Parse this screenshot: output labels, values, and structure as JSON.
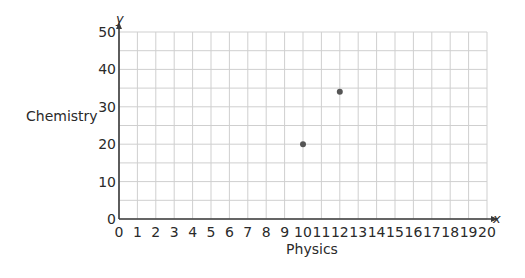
{
  "chart_data": {
    "type": "scatter",
    "title": "",
    "xlabel": "Physics",
    "ylabel": "Chemistry",
    "x_axis_var": "x",
    "y_axis_var": "y",
    "xlim": [
      0,
      20
    ],
    "ylim": [
      0,
      50
    ],
    "x_ticks": [
      0,
      1,
      2,
      3,
      4,
      5,
      6,
      7,
      8,
      9,
      10,
      11,
      12,
      13,
      14,
      15,
      16,
      17,
      18,
      19,
      20
    ],
    "y_ticks": [
      0,
      10,
      20,
      30,
      40,
      50
    ],
    "grid": true,
    "grid_x_step": 1,
    "grid_y_step": 5,
    "points": [
      {
        "x": 10,
        "y": 20
      },
      {
        "x": 12,
        "y": 34
      }
    ],
    "colors": {
      "grid": "#cfcfcf",
      "axis": "#3a3a3a",
      "point": "#555555"
    }
  }
}
